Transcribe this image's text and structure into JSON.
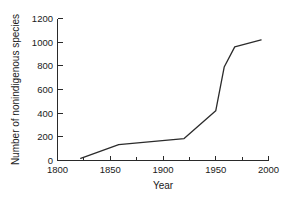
{
  "chart_data": {
    "type": "line",
    "title": "",
    "xlabel": "Year",
    "ylabel": "Number of nonindigenous species",
    "xlim": [
      1800,
      2000
    ],
    "ylim": [
      0,
      1200
    ],
    "xticks": [
      1800,
      1850,
      1900,
      1950,
      2000
    ],
    "xtick_labels": [
      "1800",
      "1850",
      "1900",
      "1950",
      "2000"
    ],
    "xminor_ticks": [
      1825,
      1875,
      1925,
      1975
    ],
    "yticks": [
      0,
      200,
      400,
      600,
      800,
      1000,
      1200
    ],
    "ytick_labels": [
      "0",
      "200",
      "400",
      "600",
      "800",
      "1000",
      "1200"
    ],
    "grid": false,
    "legend": false,
    "series": [
      {
        "name": "Nonindigenous species",
        "color": "#2b2b2b",
        "x": [
          1822,
          1858,
          1920,
          1950,
          1958,
          1968,
          1993
        ],
        "values": [
          18,
          135,
          185,
          420,
          790,
          960,
          1020
        ]
      }
    ]
  },
  "axes": {
    "x_axis_title": "Year",
    "y_axis_title": "Number of nonindigenous species"
  },
  "labels": {
    "y": [
      "1200",
      "1000",
      "800",
      "600",
      "400",
      "200",
      "0"
    ],
    "x": [
      "1800",
      "1850",
      "1900",
      "1950",
      "2000"
    ]
  }
}
